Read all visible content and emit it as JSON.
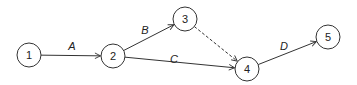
{
  "diagram": {
    "type": "activity-on-arrow network",
    "nodes": [
      {
        "id": "1",
        "label": "1",
        "x": 29,
        "y": 55
      },
      {
        "id": "2",
        "label": "2",
        "x": 113,
        "y": 56
      },
      {
        "id": "3",
        "label": "3",
        "x": 185,
        "y": 19
      },
      {
        "id": "4",
        "label": "4",
        "x": 247,
        "y": 69
      },
      {
        "id": "5",
        "label": "5",
        "x": 328,
        "y": 37
      }
    ],
    "edges": [
      {
        "from": "1",
        "to": "2",
        "label": "A",
        "style": "solid",
        "label_x": 72,
        "label_y": 46
      },
      {
        "from": "2",
        "to": "3",
        "label": "B",
        "style": "solid",
        "label_x": 145,
        "label_y": 30
      },
      {
        "from": "2",
        "to": "4",
        "label": "C",
        "style": "solid",
        "label_x": 174,
        "label_y": 59
      },
      {
        "from": "3",
        "to": "4",
        "label": "",
        "style": "dashed",
        "label_x": 0,
        "label_y": 0
      },
      {
        "from": "4",
        "to": "5",
        "label": "D",
        "style": "solid",
        "label_x": 284,
        "label_y": 46
      }
    ],
    "node_radius": 12,
    "colors": {
      "stroke": "#333333",
      "text": "#222222",
      "background": "#ffffff"
    }
  }
}
